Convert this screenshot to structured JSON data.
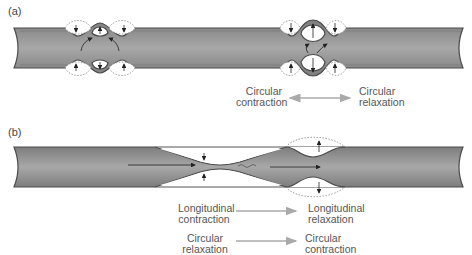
{
  "panels": [
    {
      "id": "a",
      "label": "(a)",
      "labels": {
        "left": [
          "Circular",
          "contraction"
        ],
        "right": [
          "Circular",
          "relaxation"
        ]
      },
      "arrow_type": "bidirectional"
    },
    {
      "id": "b",
      "label": "(b)",
      "rows": [
        {
          "left": [
            "Longitudinal",
            "contraction"
          ],
          "right": [
            "Longitudinal",
            "relaxation"
          ]
        },
        {
          "left": [
            "Circular",
            "relaxation"
          ],
          "right": [
            "Circular",
            "contraction"
          ]
        }
      ],
      "arrow_type": "forward"
    }
  ],
  "colors": {
    "tube_fill": "#8f8f8f",
    "tube_edge": "#5a5a5a",
    "arrow_gray": "#aaaaaa",
    "text": "#555555"
  }
}
